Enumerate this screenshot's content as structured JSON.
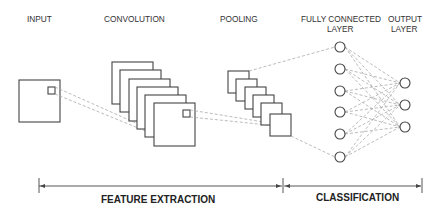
{
  "labels": {
    "input": "INPUT",
    "convolution": "CONVOLUTION",
    "pooling": "POOLING",
    "fully_connected_line1": "FULLY CONNECTED",
    "fully_connected_line2": "LAYER",
    "output_line1": "OUTPUT",
    "output_line2": "LAYER"
  },
  "sections": {
    "feature_extraction": "FEATURE EXTRACTION",
    "classification": "CLASSIFICATION"
  },
  "structure": {
    "convolution_feature_maps": 6,
    "pooling_feature_maps": 6,
    "fully_connected_nodes": 6,
    "output_nodes": 3
  },
  "colors": {
    "stroke": "#444444",
    "connection": "#aaaaaa",
    "text": "#333333"
  }
}
